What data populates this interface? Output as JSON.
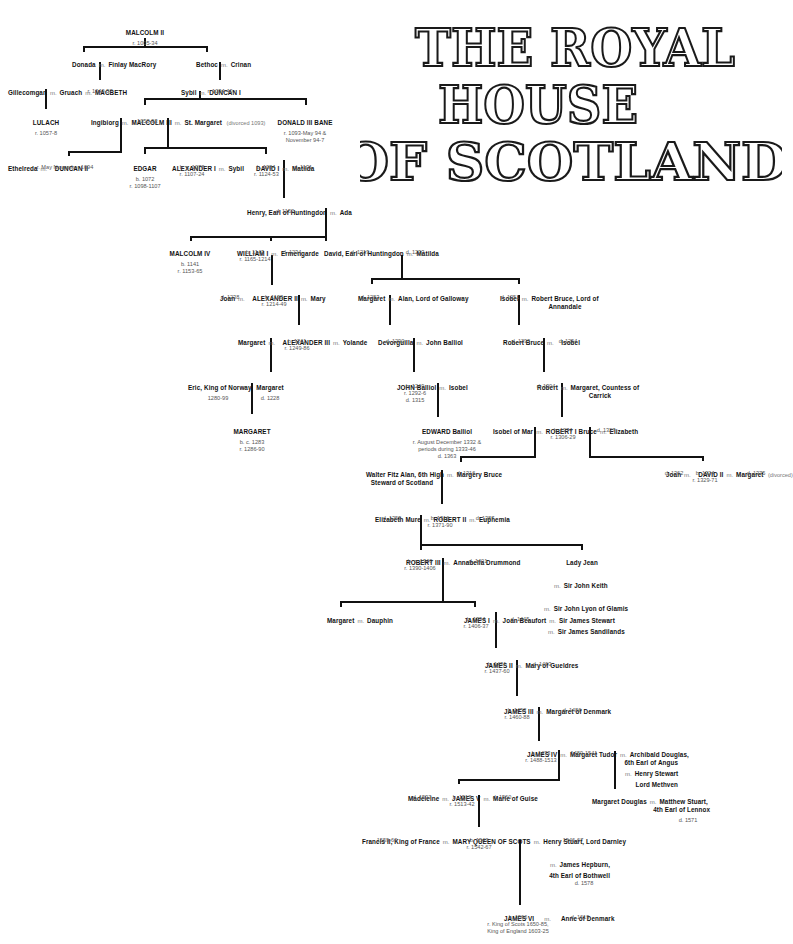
{
  "title": {
    "line1": "THE ROYAL",
    "line2": "HOUSE",
    "line3": "OF SCOTLAND"
  },
  "marriage_symbol": "m.",
  "people": {
    "malcolm2": {
      "name": "MALCOLM II",
      "l1": "r. 1005-34"
    },
    "donada": {
      "name": "Donada"
    },
    "finlay": {
      "name": "Finlay MacRory"
    },
    "bethoc": {
      "name": "Bethoc"
    },
    "crinan": {
      "name": "Crinan"
    },
    "gillecomgan": {
      "name": "Gillecomgan"
    },
    "gruach": {
      "name": "Gruach"
    },
    "macbeth": {
      "name": "MACBETH",
      "l1": "r. 1040-57"
    },
    "sybil1": {
      "name": "Sybil"
    },
    "duncan1": {
      "name": "DUNCAN I",
      "l1": "r. 1034-40"
    },
    "lulach": {
      "name": "LULACH",
      "l1": "r. 1057-8"
    },
    "ingibiorg": {
      "name": "Ingibiorg"
    },
    "malcolm3": {
      "name": "MALCOLM III",
      "l1": "r. 1058-93"
    },
    "stmargaret": {
      "name": "St. Margaret",
      "note": "(divorced 1093)"
    },
    "donald3": {
      "name": "DONALD III BANE",
      "l1": "r. 1093-May 94 &",
      "l2": "November 94-7"
    },
    "ethelreda": {
      "name": "Ethelreda"
    },
    "duncan2": {
      "name": "DUNCAN II",
      "l1": "r. May November 1094"
    },
    "edgar": {
      "name": "EDGAR",
      "l1": "b. 1072",
      "l2": "r. 1098-1107"
    },
    "alexander1": {
      "name": "ALEXANDER I",
      "l1": "b. c. 1078",
      "l2": "r. 1107-24"
    },
    "sybil2": {
      "name": "Sybil"
    },
    "david1": {
      "name": "DAVID I",
      "l1": "b. 1084",
      "l2": "r. 1124-53"
    },
    "matilda1": {
      "name": "Matilda",
      "l1": "d. 1131"
    },
    "henry": {
      "name": "Henry, Earl of Huntingdon",
      "l1": "d. 1152"
    },
    "ada": {
      "name": "Ada"
    },
    "malcolm4": {
      "name": "MALCOLM IV",
      "l1": "b. 1141",
      "l2": "r. 1153-65"
    },
    "william1": {
      "name": "WILLIAM I",
      "l1": "b. 1143",
      "l2": "r. 1165-1214"
    },
    "ermengarde": {
      "name": "Ermengarde",
      "l1": "d. 1234"
    },
    "davidhunt": {
      "name": "David, Earl of Huntingdon",
      "l1": "d. 1219"
    },
    "matilda2": {
      "name": "Matilda",
      "l1": "d. 1233"
    },
    "joan1": {
      "name": "Joan",
      "l1": "d. 1238"
    },
    "alexander2": {
      "name": "ALEXANDER II",
      "l1": "b. 1198",
      "l2": "r. 1214-49"
    },
    "mary1": {
      "name": "Mary"
    },
    "margaretgal": {
      "name": "Margaret",
      "l1": "d. 1283"
    },
    "alan": {
      "name": "Alan, Lord of Galloway"
    },
    "isobel1": {
      "name": "Isobel",
      "l1": "d. 1251"
    },
    "robertbruce1": {
      "name": "Robert Bruce, Lord of",
      "l2": "Annandale"
    },
    "margaret3": {
      "name": "Margaret"
    },
    "alexander3": {
      "name": "ALEXANDER III",
      "l1": "b. 1241",
      "l2": "r. 1249-86"
    },
    "yolande": {
      "name": "Yolande"
    },
    "devorguilla": {
      "name": "Devorguilla",
      "l1": "d. 1290"
    },
    "johnballiol1": {
      "name": "John Balliol"
    },
    "robertbruce2": {
      "name": "Robert Bruce",
      "l1": "d. 1295"
    },
    "isobel2": {
      "name": "Isobel",
      "l1": "d. 1254"
    },
    "eric": {
      "name": "Eric, King of Norway",
      "l1": "1280-99"
    },
    "margaretnor": {
      "name": "Margaret",
      "l1": "d. 1228"
    },
    "johnballiol2": {
      "name": "JOHN Balliol",
      "l1": "b. 1249",
      "l2": "r. 1292-6",
      "l3": "d. 1315"
    },
    "isobel3": {
      "name": "Isobel"
    },
    "robert": {
      "name": "Robert",
      "l1": "d. 1304"
    },
    "margaretcarrick": {
      "name": "Margaret, Countess of",
      "l2": "Carrick"
    },
    "margaretmaid": {
      "name": "MARGARET",
      "l1": "b. c. 1283",
      "l2": "r. 1286-90"
    },
    "edwardballiol": {
      "name": "EDWARD Balliol",
      "l1": "r. August December 1332 &",
      "l2": "periods during 1333-46",
      "l3": "d. 1363"
    },
    "isobelmar": {
      "name": "Isobel of Mar"
    },
    "robert1": {
      "name": "ROBERT I Bruce",
      "l1": "b. 1274",
      "l2": "r. 1306-29"
    },
    "elizabeth1": {
      "name": "Elizabeth",
      "l1": "d. 1327"
    },
    "walter": {
      "name": "Walter Fitz Alan, 6th High",
      "l2": "Steward of Scotland"
    },
    "margery": {
      "name": "Margery Bruce",
      "l1": "d. 1316"
    },
    "joan2": {
      "name": "Joan",
      "l1": "d. 1362"
    },
    "david2": {
      "name": "DAVID II",
      "l1": "b. 1324",
      "l2": "r. 1329-71"
    },
    "margaretdrum": {
      "name": "Margaret",
      "note": "(divorced)",
      "l1": "d. 1375"
    },
    "elizabethmure": {
      "name": "Elizabeth Mure",
      "l1": "d. 1355"
    },
    "robert2": {
      "name": "ROBERT II",
      "l1": "b. 1316",
      "l2": "r. 1371-90"
    },
    "euphemia": {
      "name": "Euphemia",
      "l1": "d. 1387"
    },
    "robert3": {
      "name": "ROBERT III",
      "l1": "b. c. 1340",
      "l2": "r. 1390-1406"
    },
    "annabella": {
      "name": "Annabella Drummond",
      "l1": "d. 1401"
    },
    "ladyjean": {
      "name": "Lady Jean",
      "h1": "Sir John Keith",
      "h2": "Sir John Lyon of Glamis",
      "h3": "Sir James Sandilands"
    },
    "margaretdau": {
      "name": "Margaret"
    },
    "dauphin": {
      "name": "Dauphin"
    },
    "james1": {
      "name": "JAMES I",
      "l1": "b. 1394",
      "l2": "r. 1406-37"
    },
    "joanbeaufort": {
      "name": "Joan Beaufort",
      "l1": "d. 1445"
    },
    "jamesstewart": {
      "name": "Sir James Stewart"
    },
    "james2": {
      "name": "JAMES II",
      "l1": "b. 1431",
      "l2": "r. 1437-60"
    },
    "marygueld": {
      "name": "Mary of Gueldres",
      "l1": "d. 1463"
    },
    "james3": {
      "name": "JAMES III",
      "l1": "b. 1452",
      "l2": "r. 1460-88"
    },
    "margaretden": {
      "name": "Margaret of Denmark",
      "l1": "d. 1486"
    },
    "james4": {
      "name": "JAMES IV",
      "l1": "b. 1473",
      "l2": "r. 1488-1513"
    },
    "margarettudor": {
      "name": "Margaret Tudor",
      "l1": "1489-1541"
    },
    "archibald": {
      "name": "Archibald Douglas,",
      "l2": "6th Earl of Angus"
    },
    "henrystewart": {
      "name": "Henry Stewart",
      "l2": "Lord Methven"
    },
    "margaretdouglas": {
      "name": "Margaret Douglas"
    },
    "matthew": {
      "name": "Matthew Stuart,",
      "l2": "4th Earl of Lennox",
      "l3": "d. 1571"
    },
    "madeleine": {
      "name": "Madeleine",
      "l1": "d. 1537"
    },
    "james5": {
      "name": "JAMES V",
      "l1": "b. 1512",
      "l2": "r. 1513-42"
    },
    "marieguise": {
      "name": "Marie of Guise",
      "l1": "d. 1560"
    },
    "francis2": {
      "name": "Francis II, King of France",
      "l1": "1559-60"
    },
    "maryqos": {
      "name": "MARY QUEEN OF SCOTS",
      "l1": "b. 1542",
      "l2": "r. 1542-67"
    },
    "darnley": {
      "name": "Henry Stuart, Lord Darnley",
      "l1": "1546-67"
    },
    "bothwell": {
      "name": "James Hepburn,",
      "l2": "4th Earl of Bothwell",
      "l3": "d. 1578"
    },
    "james6": {
      "name": "JAMES VI",
      "l1": "b. 1566",
      "l2": "r. King of Scots 1650-85,",
      "l3": "King of England 1603-25"
    },
    "anneden": {
      "name": "Anne of Denmark",
      "l1": "d. 1619"
    }
  }
}
